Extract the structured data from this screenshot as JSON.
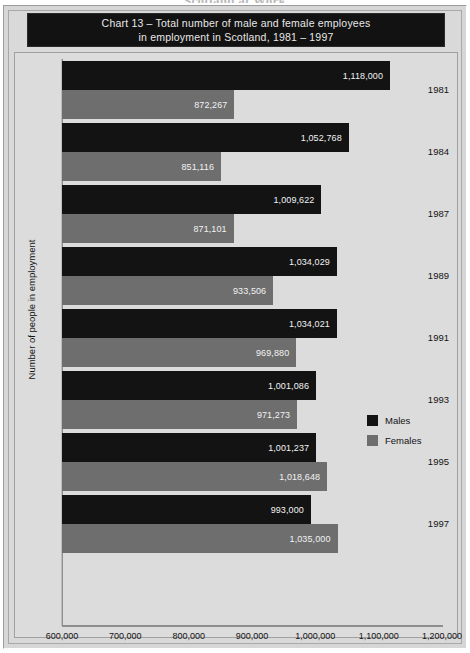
{
  "running_header": "Scotland at Work",
  "title": {
    "line1": "Chart 13 – Total number of male and female employees",
    "line2": "in employment in Scotland, 1981 – 1997"
  },
  "legend": {
    "position": "right-middle",
    "items": [
      {
        "label": "Males",
        "color": "#131313"
      },
      {
        "label": "Females",
        "color": "#6e6e6e"
      }
    ]
  },
  "colors": {
    "males": "#131313",
    "females": "#6e6e6e",
    "panel_background": "#dcdcdc",
    "figure_background": "#d6d6d6",
    "title_background": "#121212",
    "title_text": "#e8e8e8",
    "axis_line": "#8e8e8e",
    "bar_label_text": "#f2f2f2"
  },
  "chart_data": {
    "type": "bar",
    "orientation": "horizontal",
    "title": "Chart 13 – Total number of male and female employees in employment in Scotland, 1981 – 1997",
    "xlabel": "",
    "ylabel": "Number of people in employment",
    "categories": [
      "1981",
      "1984",
      "1987",
      "1989",
      "1991",
      "1993",
      "1995",
      "1997"
    ],
    "series": [
      {
        "name": "Males",
        "color": "#131313",
        "values": [
          1118000,
          1052768,
          1009622,
          1034029,
          1034021,
          1001086,
          1001237,
          993000
        ],
        "labels": [
          "1,118,000",
          "1,052,768",
          "1,009,622",
          "1,034,029",
          "1,034,021",
          "1,001,086",
          "1,001,237",
          "993,000"
        ]
      },
      {
        "name": "Females",
        "color": "#6e6e6e",
        "values": [
          872267,
          851116,
          871101,
          933506,
          969880,
          971273,
          1018648,
          1035000
        ],
        "labels": [
          "872,267",
          "851,116",
          "871,101",
          "933,506",
          "969,880",
          "971,273",
          "1,018,648",
          "1,035,000"
        ]
      }
    ],
    "xlim": [
      600000,
      1200000
    ],
    "xticks": [
      600000,
      700000,
      800000,
      900000,
      1000000,
      1100000,
      1200000
    ],
    "xtick_labels": [
      "600,000",
      "700,000",
      "800,000",
      "900,000",
      "1,000,000",
      "1,100,000",
      "1,200,000"
    ],
    "grid": false,
    "legend_position": "right"
  }
}
